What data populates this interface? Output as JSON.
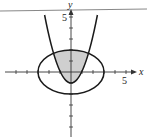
{
  "diagram": {
    "axes": {
      "x_label": "x",
      "y_label": "y",
      "x_tick_label": "5",
      "y_tick_label": "5",
      "x_range": [
        -6,
        5.5
      ],
      "y_range": [
        -5.5,
        5.5
      ]
    },
    "curves": [
      {
        "name": "parabola",
        "equation": "y = x^2 - 1"
      },
      {
        "name": "ellipse",
        "equation": "x^2/9 + y^2/4 = 1"
      }
    ],
    "shaded_region": "inside ellipse and above parabola",
    "colors": {
      "curve": "#1a1a1a",
      "shade": "#cfcfcf",
      "axis": "#333333",
      "top_rule": "#888888"
    }
  }
}
